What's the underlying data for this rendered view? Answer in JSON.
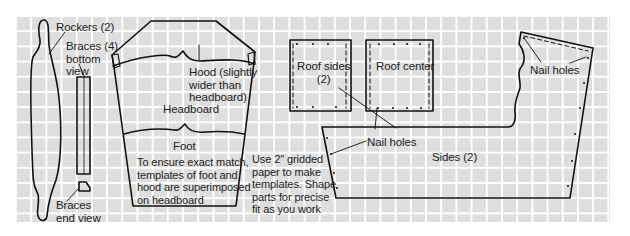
{
  "diagram": {
    "type": "woodworking template layout on grid paper",
    "grid": {
      "cell_color": "#dedede",
      "line_color": "#ffffff",
      "cell_size_px": 15
    },
    "stroke_color": "#111111",
    "labels": {
      "rockers": "Rockers (2)",
      "braces_bottom": "Braces (4)\nbottom\nview",
      "braces_end": "Braces\nend view",
      "hood": "Hood (slightly\nwider than\nheadboard)",
      "headboard": "Headboard",
      "foot": "Foot",
      "match_note": "To ensure exact match,\ntemplates of foot  and\nhood are superimposed\non headboard",
      "grid_note": "Use 2″ gridded\npaper to make\ntemplates. Shape\nparts for precise\nfit as you work",
      "roof_sides": "Roof sides\n(2)",
      "roof_center": "Roof center",
      "nail_holes_center": "Nail holes",
      "nail_holes_right": "Nail holes",
      "sides": "Sides (2)"
    }
  }
}
